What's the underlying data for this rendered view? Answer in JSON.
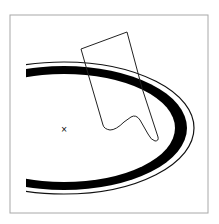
{
  "figure": {
    "width": 219,
    "height": 224,
    "background": "#ffffff",
    "frame": {
      "x": 10,
      "y": 15,
      "width": 198,
      "height": 198,
      "stroke": "#a8a8a8"
    },
    "clip_left_x": 26,
    "ellipse": {
      "cx": 64,
      "cy": 128,
      "band_outer": {
        "rx": 123,
        "ry": 62
      },
      "band_inner": {
        "rx": 111,
        "ry": 54
      },
      "thin_outline": {
        "rx": 130,
        "ry": 66
      },
      "band_color": "#000000",
      "outline_color": "#111111"
    },
    "polygon": {
      "path": "M81,49 L127,32 L142,88 L158,137 Q159,141 155,141 Q151,140 148,134 L140,120 Q136,114 131,117 L124,122 Q116,130 110,130 Q104,129 103,125 L89,77 Z",
      "stroke": "#222222"
    },
    "center_marker": {
      "x": 64,
      "y": 129,
      "symbol": "×"
    }
  }
}
